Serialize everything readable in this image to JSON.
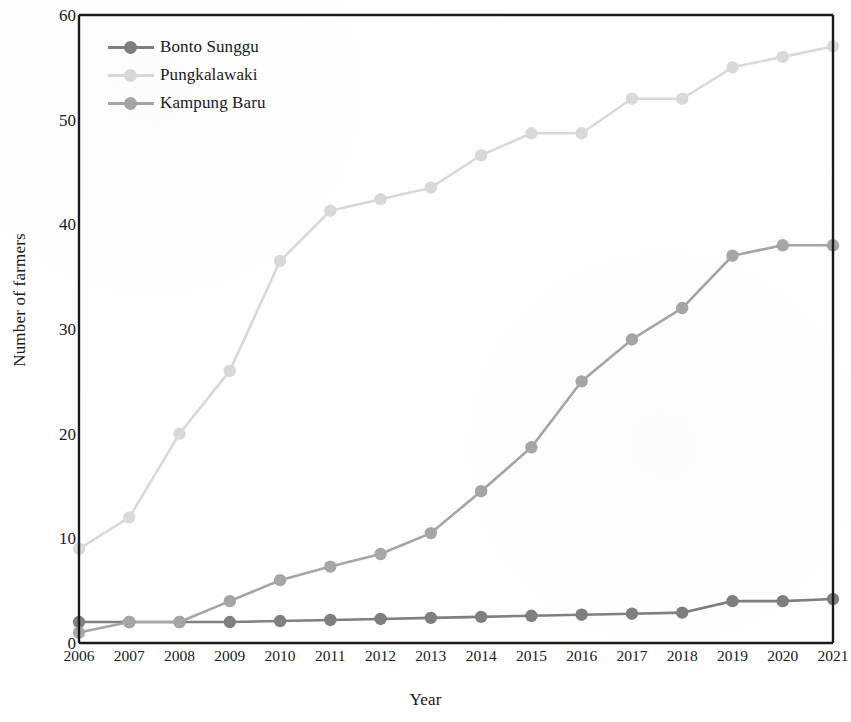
{
  "chart_data": {
    "type": "line",
    "title": "",
    "xlabel": "Year",
    "ylabel": "Number of farmers",
    "categories": [
      "2006",
      "2007",
      "2008",
      "2009",
      "2010",
      "2011",
      "2012",
      "2013",
      "2014",
      "2015",
      "2016",
      "2017",
      "2018",
      "2019",
      "2020",
      "2021"
    ],
    "ylim": [
      0,
      60
    ],
    "yticks": [
      "0",
      "10",
      "20",
      "30",
      "40",
      "50",
      "60"
    ],
    "ytick_values": [
      0,
      10,
      20,
      30,
      40,
      50,
      60
    ],
    "grid": false,
    "legend_position": "top-left",
    "series": [
      {
        "name": "Bonto Sunggu",
        "color": "#7f7f7f",
        "values": [
          2,
          2,
          2,
          2,
          2.1,
          2.2,
          2.3,
          2.4,
          2.5,
          2.6,
          2.7,
          2.8,
          2.9,
          4,
          4,
          4.2
        ]
      },
      {
        "name": "Pungkalawaki",
        "color": "#d9d9d9",
        "values": [
          9,
          12,
          20,
          26,
          36.5,
          41.3,
          42.4,
          43.5,
          46.6,
          48.7,
          48.7,
          52,
          52,
          55,
          56,
          57
        ]
      },
      {
        "name": "Kampung Baru",
        "color": "#a6a6a6",
        "values": [
          1,
          2,
          2,
          4,
          6,
          7.3,
          8.5,
          10.5,
          14.5,
          18.7,
          25,
          29,
          32,
          37,
          38,
          38
        ]
      }
    ]
  },
  "axes": {
    "x_title": "Year",
    "y_title": "Number of farmers"
  },
  "legend": {
    "items": [
      {
        "label": "Bonto Sunggu"
      },
      {
        "label": "Pungkalawaki"
      },
      {
        "label": "Kampung Baru"
      }
    ]
  },
  "colors": {
    "axis": "#1a1a1a",
    "background": "#ffffff",
    "bonto_sunggu": "#7f7f7f",
    "pungkalawaki": "#d9d9d9",
    "kampung_baru": "#a6a6a6"
  }
}
